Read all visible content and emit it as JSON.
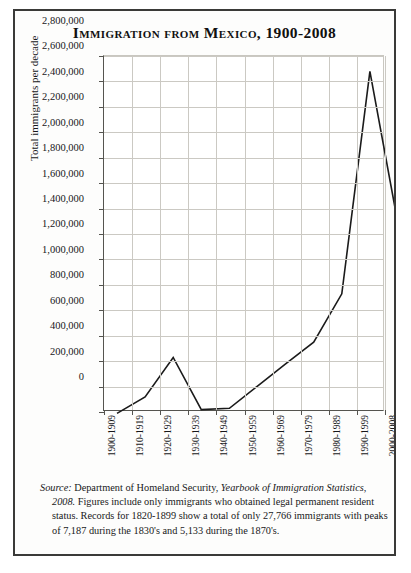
{
  "figure": {
    "title": "Immigration from Mexico, 1900-2008",
    "source_note": {
      "source_label": "Source:",
      "publisher": "Department of Homeland Security,",
      "publication": "Yearbook of Immigration Statistics, 2008.",
      "rest": "Figures include only immigrants who obtained legal permanent resident status. Records for 1820-1899 show a total of only 27,766 immigrants with peaks of 7,187 during the 1830's and 5,133 during the 1870's."
    },
    "colors": {
      "border": "#3a3a38",
      "line": "#1b1b1b",
      "grid": "#cbc9c3",
      "axis": "#55544f",
      "background": "#fdfdfc"
    }
  },
  "chart_data": {
    "type": "line",
    "title": "Immigration from Mexico, 1900-2008",
    "xlabel": "",
    "ylabel": "Total immigrants per decade",
    "categories": [
      "1900-1909",
      "1910-1919",
      "1920-1929",
      "1930-1939",
      "1940-1949",
      "1950-1959",
      "1960-1969",
      "1970-1979",
      "1980-1989",
      "1990-1999",
      "2000-2008"
    ],
    "values": [
      60000,
      190000,
      500000,
      90000,
      100000,
      275000,
      450000,
      620000,
      1000000,
      2750000,
      1550000
    ],
    "ylim": [
      0,
      2800000
    ],
    "ytick_labels": [
      "2,800,000",
      "2,600,000",
      "2,400,000",
      "2,200,000",
      "2,000,000",
      "1,800,000",
      "1,600,000",
      "1,400,000",
      "1,200,000",
      "1,000,000",
      "800,000",
      "600,000",
      "400,000",
      "200,000",
      "0"
    ],
    "ytick_values": [
      2800000,
      2600000,
      2400000,
      2200000,
      2000000,
      1800000,
      1600000,
      1400000,
      1200000,
      1000000,
      800000,
      600000,
      400000,
      200000,
      0
    ],
    "grid": true,
    "legend": "none"
  }
}
